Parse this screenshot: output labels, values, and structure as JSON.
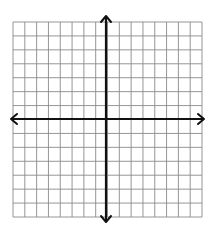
{
  "diagram": {
    "type": "coordinate-plane",
    "grid": {
      "columns": 16,
      "rows": 14,
      "left": 13,
      "top": 22,
      "right": 202,
      "bottom": 217,
      "line_color": "#8a8a8a",
      "background": "#ffffff"
    },
    "axes": {
      "x_axis_y": 119,
      "y_axis_x": 106,
      "color": "#111111",
      "arrows": [
        "up",
        "down",
        "left",
        "right"
      ],
      "x_extent": [
        11,
        204
      ],
      "y_extent": [
        16,
        222
      ]
    },
    "labels": []
  }
}
